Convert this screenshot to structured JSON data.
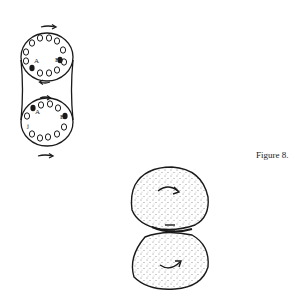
{
  "figure": {
    "caption": "Figure 8.",
    "top_drawing": {
      "description": "Two rigid rotating discs with rings of holes, joined by a stretched waist, opposite rotation arrows",
      "labels": {
        "upper_A": "A",
        "upper_B": "B",
        "lower_A": "A",
        "lower_B": "B",
        "lower_j": "j"
      }
    },
    "bottom_drawing": {
      "description": "Two stippled rounded blobs touching at a neck, each with a curved clockwise rotation arrow"
    }
  },
  "colors": {
    "ink": "#1a1a1a",
    "paper": "#ffffff"
  }
}
